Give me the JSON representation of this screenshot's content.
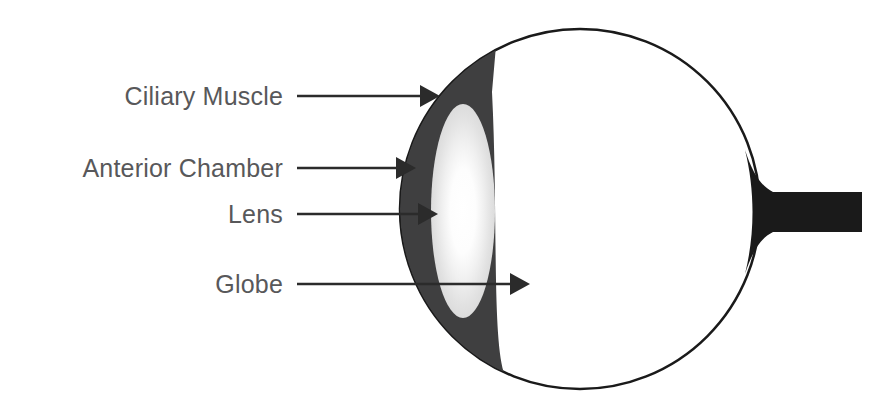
{
  "figure": {
    "background_color": "#ffffff"
  },
  "colors": {
    "label_text": "#58585a",
    "leader_line": "#2b2b2b",
    "globe_outline": "#1a1a1a",
    "globe_fill": "#ffffff",
    "ciliary_muscle": "#3f3f40",
    "lens_edge": "#dcdcdc",
    "lens_center": "#ffffff",
    "optic_nerve": "#1a1a1a"
  },
  "labels": [
    {
      "id": "ciliary-muscle",
      "text": "Ciliary Muscle",
      "text_x": 283,
      "text_y": 105,
      "line_x1": 297,
      "line_x2": 422,
      "line_y": 96,
      "tip_x": 440
    },
    {
      "id": "anterior-chamber",
      "text": "Anterior Chamber",
      "text_x": 283,
      "text_y": 177,
      "line_x1": 297,
      "line_x2": 398,
      "line_y": 168,
      "tip_x": 416
    },
    {
      "id": "lens",
      "text": "Lens",
      "text_x": 283,
      "text_y": 223,
      "line_x1": 297,
      "line_x2": 420,
      "line_y": 214,
      "tip_x": 438
    },
    {
      "id": "globe",
      "text": "Globe",
      "text_x": 283,
      "text_y": 293,
      "line_x1": 297,
      "line_x2": 512,
      "line_y": 284,
      "tip_x": 530
    }
  ],
  "anatomy": {
    "globe": {
      "name": "Globe",
      "center_x": 580,
      "center_y": 209,
      "radius": 180,
      "stroke_width": 2.5
    },
    "ciliary_muscle": {
      "name": "Ciliary Muscle",
      "right_edge_x": 492,
      "top_y": 50,
      "bottom_y": 372
    },
    "lens": {
      "name": "Lens",
      "center_x": 463,
      "center_y": 211,
      "radius_x": 32,
      "radius_y": 107
    },
    "optic_nerve": {
      "name": "Optic Nerve",
      "attach_x": 757,
      "end_x": 862,
      "top_y": 192,
      "bottom_y": 232,
      "flare_top_y": 150,
      "flare_bottom_y": 274
    },
    "arrow_head": {
      "length": 20,
      "half_height": 11
    }
  }
}
